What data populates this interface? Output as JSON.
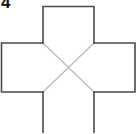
{
  "figure": {
    "label": "4",
    "shape": "plus-cross-net",
    "colors": {
      "outline": "#4a4a4a",
      "diagonal": "#b8b8b8",
      "background": "#ffffff",
      "label": "#111111"
    }
  }
}
